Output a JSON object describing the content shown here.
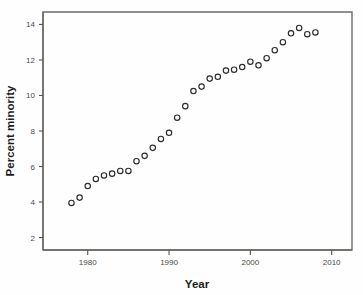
{
  "chart_data": {
    "type": "scatter",
    "title": "",
    "xlabel": "Year",
    "ylabel": "Percent minority",
    "xlim": [
      1974.5,
      2012.5
    ],
    "ylim": [
      1.3,
      14.7
    ],
    "xticks": [
      1980,
      1990,
      2000,
      2010
    ],
    "yticks": [
      2,
      4,
      6,
      8,
      10,
      12,
      14
    ],
    "xtick_labels": [
      "1980",
      "1990",
      "2000",
      "2010"
    ],
    "ytick_labels": [
      "2",
      "4",
      "6",
      "8",
      "10",
      "12",
      "14"
    ],
    "grid": false,
    "legend": null,
    "marker": "open-circle",
    "marker_color": "#2b2b28",
    "series": [
      {
        "name": "Percent minority",
        "x": [
          1978,
          1979,
          1980,
          1981,
          1982,
          1983,
          1984,
          1985,
          1986,
          1987,
          1988,
          1989,
          1990,
          1991,
          1992,
          1993,
          1994,
          1995,
          1996,
          1997,
          1998,
          1999,
          2000,
          2001,
          2002,
          2003,
          2004,
          2005,
          2006,
          2007,
          2008
        ],
        "y": [
          3.95,
          4.25,
          4.9,
          5.3,
          5.5,
          5.6,
          5.75,
          5.75,
          6.3,
          6.6,
          7.05,
          7.55,
          7.9,
          8.75,
          9.4,
          10.25,
          10.5,
          10.95,
          11.05,
          11.4,
          11.45,
          11.6,
          11.9,
          11.7,
          12.1,
          12.55,
          13.0,
          13.5,
          13.8,
          13.45,
          13.55
        ]
      }
    ]
  },
  "axes": {
    "x_title": "Year",
    "y_title": "Percent minority"
  }
}
